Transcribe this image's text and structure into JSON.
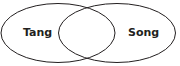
{
  "diagram": {
    "type": "venn",
    "sets": [
      {
        "label": "Tang"
      },
      {
        "label": "Song"
      }
    ],
    "stroke_color": "#231f20"
  }
}
